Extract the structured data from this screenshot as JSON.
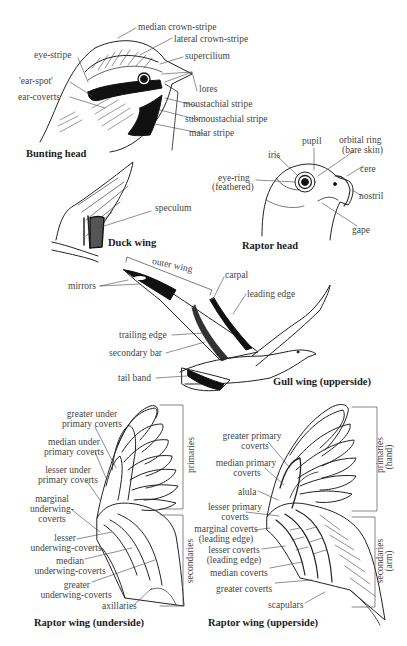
{
  "bunting_head": {
    "caption": "Bunting head",
    "labels": {
      "median_crown_stripe": "median crown-stripe",
      "lateral_crown_stripe": "lateral crown-stripe",
      "eye_stripe": "eye-stripe",
      "supercilium": "supercilium",
      "ear_spot": "'ear-spot'",
      "lores": "lores",
      "ear_coverts": "ear-coverts",
      "moustachial_stripe": "moustachial stripe",
      "submoustachial_stripe": "submoustachial stripe",
      "malar_stripe": "malar stripe"
    }
  },
  "raptor_head": {
    "caption": "Raptor head",
    "labels": {
      "pupil": "pupil",
      "orbital_ring_1": "orbital ring",
      "orbital_ring_2": "(bare skin)",
      "iris": "iris",
      "cere": "cere",
      "eye_ring_1": "eye-ring",
      "eye_ring_2": "(feathered)",
      "nostril": "nostril",
      "gape": "gape"
    }
  },
  "duck_wing": {
    "caption": "Duck wing",
    "labels": {
      "speculum": "speculum"
    }
  },
  "gull_wing": {
    "caption": "Gull wing (upperside)",
    "labels": {
      "outer_wing": "outer wing",
      "carpal": "carpal",
      "mirrors": "mirrors",
      "leading_edge": "leading edge",
      "trailing_edge": "trailing edge",
      "secondary_bar": "secondary bar",
      "tail_band": "tail band"
    }
  },
  "raptor_wing_underside": {
    "caption": "Raptor wing (underside)",
    "labels": {
      "greater_under_primary_coverts_1": "greater under",
      "greater_under_primary_coverts_2": "primary coverts",
      "median_under_primary_coverts_1": "median under",
      "median_under_primary_coverts_2": "primary coverts",
      "lesser_under_primary_coverts_1": "lesser under",
      "lesser_under_primary_coverts_2": "primary coverts",
      "marginal_underwing_coverts_1": "marginal",
      "marginal_underwing_coverts_2": "underwing-",
      "marginal_underwing_coverts_3": "coverts",
      "lesser_underwing_coverts_1": "lesser",
      "lesser_underwing_coverts_2": "underwing-coverts",
      "median_underwing_coverts_1": "median",
      "median_underwing_coverts_2": "underwing-coverts",
      "greater_underwing_coverts_1": "greater",
      "greater_underwing_coverts_2": "underwing-coverts",
      "axillaries": "axillaries",
      "primaries": "primaries",
      "secondaries": "secondaries"
    }
  },
  "raptor_wing_upperside": {
    "caption": "Raptor wing (upperside)",
    "labels": {
      "greater_primary_coverts_1": "greater primary",
      "greater_primary_coverts_2": "coverts",
      "median_primary_coverts_1": "median primary",
      "median_primary_coverts_2": "coverts",
      "alula": "alula",
      "lesser_primary_coverts_1": "lesser primary",
      "lesser_primary_coverts_2": "coverts",
      "marginal_coverts_1": "marginal coverts",
      "marginal_coverts_2": "(leading edge)",
      "lesser_coverts_1": "lesser coverts",
      "lesser_coverts_2": "(leading edge)",
      "median_coverts": "median coverts",
      "greater_coverts": "greater coverts",
      "scapulars": "scapulars",
      "primaries_1": "primaries",
      "primaries_2": "(hand)",
      "secondaries_1": "secondaries",
      "secondaries_2": "(arm)"
    }
  }
}
